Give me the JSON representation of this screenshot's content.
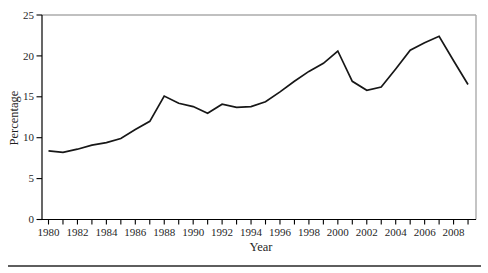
{
  "page": {
    "background": "#ffffff",
    "text_color": "#1f1f1f"
  },
  "chart_data": {
    "type": "line",
    "title": "",
    "xlabel": "Year",
    "ylabel": "Percentage",
    "x": [
      1980,
      1981,
      1982,
      1983,
      1984,
      1985,
      1986,
      1987,
      1988,
      1989,
      1990,
      1991,
      1992,
      1993,
      1994,
      1995,
      1996,
      1997,
      1998,
      1999,
      2000,
      2001,
      2002,
      2003,
      2004,
      2005,
      2006,
      2007,
      2008,
      2009
    ],
    "values": [
      8.4,
      8.2,
      8.6,
      9.1,
      9.4,
      9.9,
      11.0,
      12.0,
      15.1,
      14.2,
      13.8,
      13.0,
      14.1,
      13.7,
      13.8,
      14.4,
      15.6,
      16.9,
      18.1,
      19.1,
      20.6,
      16.9,
      15.8,
      16.2,
      18.4,
      20.7,
      21.6,
      22.4,
      19.4,
      16.5
    ],
    "xlim": [
      1979.55,
      2009.55
    ],
    "ylim": [
      0,
      25
    ],
    "y_ticks": [
      0,
      5,
      10,
      15,
      20,
      25
    ],
    "x_tick_years": [
      1980,
      1981,
      1982,
      1983,
      1984,
      1985,
      1986,
      1987,
      1988,
      1989,
      1990,
      1991,
      1992,
      1993,
      1994,
      1995,
      1996,
      1997,
      1998,
      1999,
      2000,
      2001,
      2002,
      2003,
      2004,
      2005,
      2006,
      2007,
      2008,
      2009
    ],
    "x_tick_labels": [
      "1980",
      "1982",
      "1984",
      "1986",
      "1988",
      "1990",
      "1992",
      "1994",
      "1996",
      "1998",
      "2000",
      "2002",
      "2004",
      "2006",
      "2008"
    ],
    "grid": false,
    "legend": false,
    "line_color": "#171717",
    "axis_color": "#000000",
    "border_color": "#ababab",
    "line_width": 1.7
  }
}
